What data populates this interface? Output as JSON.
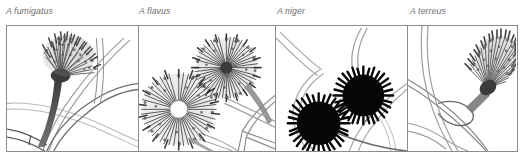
{
  "figure": {
    "caption_labels_style": "italic-gray",
    "background_color": "#ffffff",
    "border_color": "#8c8c8c",
    "label_color": "#6e6e6e",
    "panel_count": 4
  },
  "panels": [
    {
      "label": "A fumigatus",
      "label_left_px": 6,
      "width_px": 132,
      "head_shape": "columnar",
      "tone": "medium-gray",
      "description": "Single columnar conidial head on a long smooth conidiophore with a swollen foot cell, crossing hyphal strands in the background"
    },
    {
      "label": "A flavus",
      "label_left_px": 139,
      "width_px": 137,
      "head_shape": "radiate-globose",
      "tone": "medium-gray",
      "description": "Two globose radiate conidial heads with dense radiating phialides, one head seen partly in section with a pale vesicle centre"
    },
    {
      "label": "A niger",
      "label_left_px": 277,
      "width_px": 132,
      "head_shape": "globose",
      "tone": "black",
      "description": "Two very dark, almost black globose conidial heads borne on curved conidiophores, with pale hyphae in the background"
    },
    {
      "label": "A terreus",
      "label_left_px": 410,
      "width_px": 108,
      "head_shape": "columnar",
      "tone": "medium-gray",
      "description": "Columnar conidial head angled upward on a short conidiophore with a looped foot, crossing hyphae at lower left"
    }
  ]
}
